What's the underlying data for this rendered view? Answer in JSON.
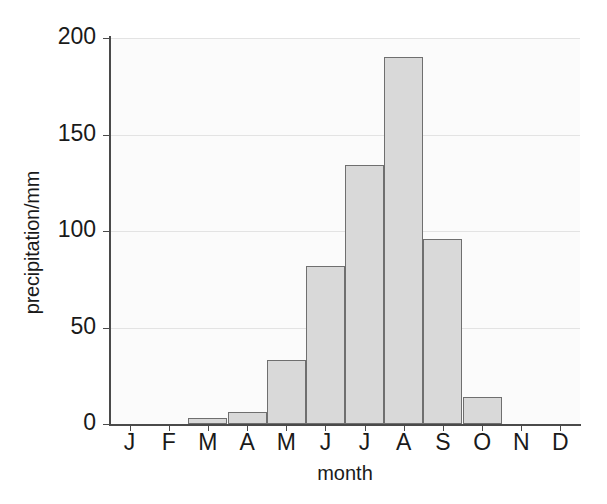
{
  "chart_data": {
    "type": "bar",
    "title": "",
    "subtitle": "",
    "xlabel": "month",
    "ylabel": "precipitation/mm",
    "categories": [
      "J",
      "F",
      "M",
      "A",
      "M",
      "J",
      "J",
      "A",
      "S",
      "O",
      "N",
      "D"
    ],
    "category_names": [
      "January",
      "February",
      "March",
      "April",
      "May",
      "June",
      "July",
      "August",
      "September",
      "October",
      "November",
      "December"
    ],
    "values": [
      0,
      0,
      3,
      6,
      33,
      82,
      134,
      190,
      96,
      14,
      0,
      0
    ],
    "series": [
      {
        "name": "precipitation",
        "values": [
          0,
          0,
          3,
          6,
          33,
          82,
          134,
          190,
          96,
          14,
          0,
          0
        ]
      }
    ],
    "ylim": [
      0,
      205
    ],
    "yticks": [
      0,
      50,
      100,
      150,
      200
    ],
    "ytick_labels": [
      "0",
      "50",
      "100",
      "150",
      "200"
    ],
    "xtick_labels": [
      "J",
      "F",
      "M",
      "A",
      "M",
      "J",
      "J",
      "A",
      "S",
      "O",
      "N",
      "D"
    ],
    "grid": true,
    "grid_axis": "y",
    "legend": false,
    "legend_position": "none",
    "bar_fill_color": "#d9d9d9",
    "bar_edge_color": "#6f6f6f",
    "axis_color": "#4a4a4a",
    "grid_color": "#e3e3e3",
    "plot_background": "#fbfbfb",
    "page_background": "#ffffff",
    "annotations": []
  }
}
